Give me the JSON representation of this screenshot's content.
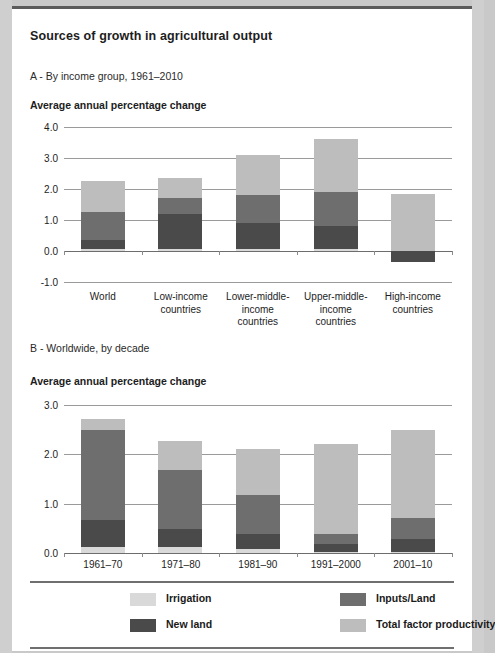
{
  "title": "Sources of growth in agricultural output",
  "panel_a": {
    "subtitle": "A - By income group, 1961–2010",
    "axis_title": "Average annual percentage change"
  },
  "panel_b": {
    "subtitle": "B - Worldwide, by decade",
    "axis_title": "Average annual percentage change"
  },
  "legend": {
    "items": [
      {
        "label": "Irrigation",
        "color": "#d9d9d9"
      },
      {
        "label": "Inputs/Land",
        "color": "#6e6e6e"
      },
      {
        "label": "New land",
        "color": "#4a4a4a"
      },
      {
        "label": "Total factor productivity",
        "color": "#bdbdbd"
      }
    ]
  },
  "colors": {
    "irrigation": "#d9d9d9",
    "inputs_land": "#6e6e6e",
    "new_land": "#4a4a4a",
    "tfp": "#bdbdbd",
    "gridline": "#9a9a9a",
    "axis": "#6d6d6d"
  },
  "chart_data": [
    {
      "type": "bar",
      "stacked": true,
      "title": "A - By income group, 1961–2010",
      "ylabel": "Average annual percentage change",
      "xlabel": "",
      "ylim": [
        -1.0,
        4.0
      ],
      "yticks": [
        "4.0",
        "3.0",
        "2.0",
        "1.0",
        "0.0",
        "-1.0"
      ],
      "ytick_values": [
        4.0,
        3.0,
        2.0,
        1.0,
        0.0,
        -1.0
      ],
      "grid": true,
      "legend_position": "bottom",
      "categories": [
        "World",
        "Low-income countries",
        "Lower-middle-income countries",
        "Upper-middle-income countries",
        "High-income countries"
      ],
      "category_lines": [
        [
          "World"
        ],
        [
          "Low-income",
          "countries"
        ],
        [
          "Lower-middle-",
          "income",
          "countries"
        ],
        [
          "Upper-middle-",
          "income",
          "countries"
        ],
        [
          "High-income",
          "countries"
        ]
      ],
      "series": [
        {
          "name": "Irrigation",
          "values": [
            0.05,
            0.05,
            0.05,
            0.05,
            0.0
          ]
        },
        {
          "name": "New land",
          "values": [
            0.3,
            1.15,
            0.85,
            0.75,
            -0.35
          ]
        },
        {
          "name": "Inputs/Land",
          "values": [
            0.9,
            0.5,
            0.9,
            1.1,
            0.0
          ]
        },
        {
          "name": "Total factor productivity",
          "values": [
            1.0,
            0.65,
            1.3,
            1.7,
            1.85
          ]
        }
      ],
      "totals": [
        2.25,
        2.35,
        3.1,
        3.6,
        1.85
      ]
    },
    {
      "type": "bar",
      "stacked": true,
      "title": "B - Worldwide, by decade",
      "ylabel": "Average annual percentage change",
      "xlabel": "",
      "ylim": [
        0.0,
        3.0
      ],
      "yticks": [
        "3.0",
        "2.0",
        "1.0",
        "0.0"
      ],
      "ytick_values": [
        3.0,
        2.0,
        1.0,
        0.0
      ],
      "grid": true,
      "legend_position": "bottom",
      "categories": [
        "1961–70",
        "1971–80",
        "1981–90",
        "1991–2000",
        "2001–10"
      ],
      "series": [
        {
          "name": "Irrigation",
          "values": [
            0.12,
            0.13,
            0.08,
            0.02,
            0.02
          ]
        },
        {
          "name": "New land",
          "values": [
            0.55,
            0.35,
            0.3,
            0.16,
            0.26
          ]
        },
        {
          "name": "Inputs/Land",
          "values": [
            1.83,
            1.2,
            0.8,
            0.2,
            0.42
          ]
        },
        {
          "name": "Total factor productivity",
          "values": [
            0.22,
            0.6,
            0.92,
            1.82,
            1.8
          ]
        }
      ],
      "totals": [
        2.72,
        2.28,
        2.1,
        2.2,
        2.5
      ]
    }
  ]
}
